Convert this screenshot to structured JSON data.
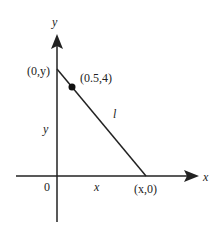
{
  "diagram": {
    "type": "coordinate-plane-line",
    "axes": {
      "x_label": "x",
      "y_label": "y",
      "origin_label": "0"
    },
    "line": {
      "label": "l",
      "y_intercept_label": "(0,y)",
      "x_intercept_label": "(x,0)",
      "point_label": "(0.5,4)"
    },
    "segment_labels": {
      "vertical": "y",
      "horizontal": "x"
    },
    "colors": {
      "stroke": "#222222",
      "background": "#ffffff"
    }
  }
}
